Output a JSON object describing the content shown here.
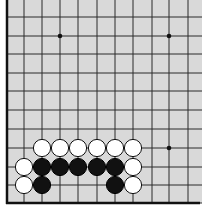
{
  "board": {
    "background": "#d9d9d9",
    "line_color": "#2a2a2a",
    "edge_color": "#111111",
    "columns_x": [
      7,
      24,
      42,
      60,
      78,
      97,
      115,
      133,
      152,
      169,
      188
    ],
    "rows_y": [
      0,
      17,
      36,
      54,
      73,
      91,
      110,
      129,
      148,
      167,
      185,
      203
    ],
    "left_edge_x": 7,
    "bottom_edge_y": 203,
    "visible_edges": [
      "left",
      "bottom"
    ],
    "star_points": [
      {
        "x": 60,
        "y": 36
      },
      {
        "x": 169,
        "y": 36
      },
      {
        "x": 169,
        "y": 148
      }
    ]
  },
  "stones": [
    {
      "color": "white",
      "x": 42,
      "y": 148
    },
    {
      "color": "white",
      "x": 60,
      "y": 148
    },
    {
      "color": "white",
      "x": 78,
      "y": 148
    },
    {
      "color": "white",
      "x": 97,
      "y": 148
    },
    {
      "color": "white",
      "x": 115,
      "y": 148
    },
    {
      "color": "white",
      "x": 133,
      "y": 148
    },
    {
      "color": "white",
      "x": 24,
      "y": 167
    },
    {
      "color": "black",
      "x": 42,
      "y": 167
    },
    {
      "color": "black",
      "x": 60,
      "y": 167
    },
    {
      "color": "black",
      "x": 78,
      "y": 167
    },
    {
      "color": "black",
      "x": 97,
      "y": 167
    },
    {
      "color": "black",
      "x": 115,
      "y": 167
    },
    {
      "color": "white",
      "x": 133,
      "y": 167
    },
    {
      "color": "white",
      "x": 24,
      "y": 185
    },
    {
      "color": "black",
      "x": 42,
      "y": 185
    },
    {
      "color": "black",
      "x": 115,
      "y": 185
    },
    {
      "color": "white",
      "x": 133,
      "y": 185
    }
  ],
  "stone_radius": 8.6
}
